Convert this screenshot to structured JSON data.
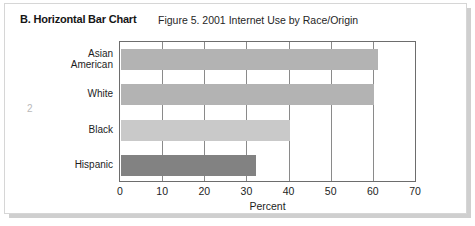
{
  "page": {
    "section_heading": "B. Horizontal Bar Chart",
    "page_number": "2",
    "background_color": "#ffffff",
    "card_border_color": "#d6d6d6"
  },
  "chart_data": {
    "type": "bar",
    "orientation": "horizontal",
    "title": "Figure 5. 2001 Internet Use by Race/Origin",
    "xlabel": "Percent",
    "ylabel": "",
    "categories": [
      "Asian American",
      "White",
      "Black",
      "Hispanic"
    ],
    "values": [
      61,
      60,
      40,
      32
    ],
    "xlim": [
      0,
      70
    ],
    "xticks": [
      0,
      10,
      20,
      30,
      40,
      50,
      60,
      70
    ],
    "xtick_labels": [
      "0",
      "10",
      "20",
      "30",
      "40",
      "50",
      "60",
      "70"
    ],
    "bar_colors": [
      "#b3b3b3",
      "#b3b3b3",
      "#c9c9c9",
      "#828282"
    ],
    "grid": "vertical",
    "legend": "none",
    "axis_color": "#6d6d6d"
  }
}
